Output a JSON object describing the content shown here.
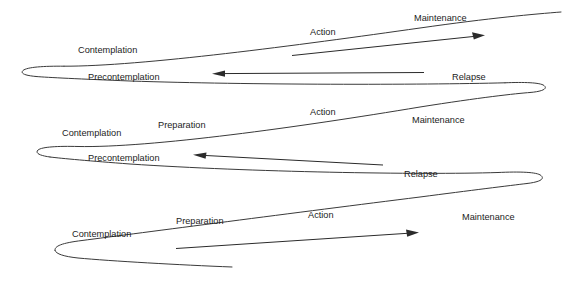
{
  "diagram": {
    "background_color": "#ffffff",
    "line_color": "#3a3a3a",
    "text_color": "#1c1c1c",
    "arrow_color": "#2b2b2b"
  },
  "labels": {
    "loop1": {
      "precontemplation": "Precontemplation",
      "contemplation": "Contemplation",
      "action": "Action",
      "maintenance": "Maintenance",
      "relapse": "Relapse"
    },
    "loop2": {
      "precontemplation": "Precontemplation",
      "contemplation": "Contemplation",
      "preparation": "Preparation",
      "action": "Action",
      "maintenance": "Maintenance",
      "relapse": "Relapse"
    },
    "loop3": {
      "contemplation": "Contemplation",
      "preparation": "Preparation",
      "action": "Action",
      "maintenance": "Maintenance"
    }
  }
}
